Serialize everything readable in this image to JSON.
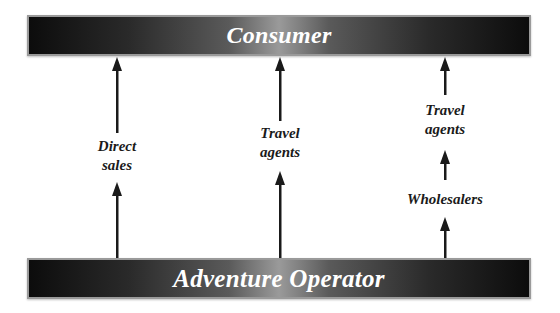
{
  "diagram": {
    "top_node": "Consumer",
    "bottom_node": "Adventure Operator",
    "channels": [
      {
        "name": "direct",
        "labels": [
          "Direct",
          "sales"
        ]
      },
      {
        "name": "travel-agents",
        "labels": [
          "Travel",
          "agents"
        ]
      },
      {
        "name": "wholesalers-travel-agents",
        "labels": [
          "Travel",
          "agents"
        ],
        "intermediate": "Wholesalers"
      }
    ]
  },
  "colors": {
    "bar_dark": "#0c0c0c",
    "bar_light": "#9a9a9a",
    "bar_text": "#ffffff",
    "arrow": "#1a1a1a",
    "label": "#1a1a1a"
  }
}
